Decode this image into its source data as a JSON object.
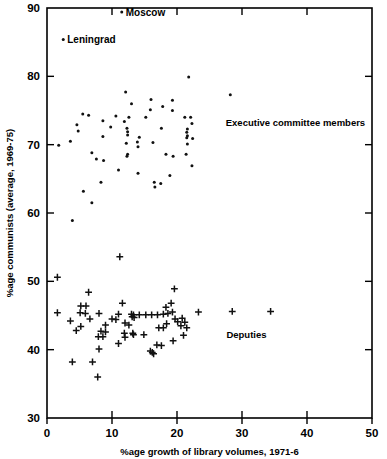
{
  "chart_data": {
    "type": "scatter",
    "title": "",
    "xlabel": "%age  growth of library volumes, 1971-6",
    "ylabel": "%age communists (average, 1969-75)",
    "xlim": [
      0,
      50
    ],
    "ylim": [
      30,
      90
    ],
    "xticks": [
      0,
      10,
      20,
      30,
      40,
      50
    ],
    "yticks": [
      30,
      40,
      50,
      60,
      70,
      80,
      90
    ],
    "xtick_labels": [
      "0",
      "10",
      "20",
      "30",
      "40",
      "50"
    ],
    "ytick_labels": [
      "30",
      "40",
      "50",
      "60",
      "70",
      "80",
      "90"
    ],
    "grid": false,
    "legend_position": "inline-annotations",
    "series": [
      {
        "name": "Executive committee members",
        "marker": "dot",
        "label_text": "Executive committee members",
        "label_x": 27.5,
        "label_y": 73.2,
        "points": [
          [
            11.5,
            89.4
          ],
          [
            2.5,
            85.4
          ],
          [
            21.8,
            79.9
          ],
          [
            12.1,
            77.7
          ],
          [
            28.2,
            77.3
          ],
          [
            16.0,
            76.6
          ],
          [
            19.3,
            76.5
          ],
          [
            13.0,
            76.0
          ],
          [
            17.8,
            75.6
          ],
          [
            15.9,
            75.1
          ],
          [
            19.3,
            75.0
          ],
          [
            5.5,
            74.5
          ],
          [
            6.4,
            74.3
          ],
          [
            10.6,
            74.2
          ],
          [
            12.6,
            74.0
          ],
          [
            15.2,
            74.0
          ],
          [
            21.2,
            74.0
          ],
          [
            22.1,
            74.0
          ],
          [
            8.6,
            73.5
          ],
          [
            11.9,
            73.4
          ],
          [
            22.3,
            73.1
          ],
          [
            4.6,
            72.9
          ],
          [
            9.8,
            72.6
          ],
          [
            12.3,
            72.4
          ],
          [
            17.6,
            72.4
          ],
          [
            21.6,
            72.3
          ],
          [
            4.8,
            72.0
          ],
          [
            12.4,
            71.9
          ],
          [
            21.5,
            71.8
          ],
          [
            12.4,
            71.4
          ],
          [
            21.6,
            71.3
          ],
          [
            8.6,
            71.2
          ],
          [
            14.2,
            71.1
          ],
          [
            21.5,
            71.0
          ],
          [
            22.4,
            70.9
          ],
          [
            1.8,
            69.9
          ],
          [
            3.6,
            70.5
          ],
          [
            13.9,
            70.4
          ],
          [
            16.3,
            70.3
          ],
          [
            12.2,
            70.2
          ],
          [
            21.6,
            70.1
          ],
          [
            14.0,
            69.7
          ],
          [
            6.9,
            68.8
          ],
          [
            12.4,
            68.6
          ],
          [
            12.3,
            68.3
          ],
          [
            18.3,
            68.6
          ],
          [
            19.4,
            68.3
          ],
          [
            21.4,
            68.6
          ],
          [
            7.6,
            67.9
          ],
          [
            8.7,
            67.7
          ],
          [
            22.3,
            66.9
          ],
          [
            11.0,
            66.3
          ],
          [
            14.0,
            65.8
          ],
          [
            18.9,
            65.5
          ],
          [
            8.3,
            64.5
          ],
          [
            16.5,
            64.5
          ],
          [
            17.5,
            64.3
          ],
          [
            16.6,
            63.8
          ],
          [
            5.6,
            63.2
          ],
          [
            6.9,
            61.5
          ],
          [
            3.9,
            58.9
          ]
        ]
      },
      {
        "name": "Deputies",
        "marker": "plus",
        "label_text": "Deputies",
        "label_x": 27.6,
        "label_y": 42.2,
        "points": [
          [
            11.2,
            53.6
          ],
          [
            1.6,
            50.6
          ],
          [
            6.4,
            48.4
          ],
          [
            19.6,
            48.9
          ],
          [
            19.1,
            46.8
          ],
          [
            11.6,
            46.8
          ],
          [
            5.2,
            46.4
          ],
          [
            6.0,
            46.4
          ],
          [
            18.3,
            46.2
          ],
          [
            1.6,
            45.4
          ],
          [
            5.1,
            45.4
          ],
          [
            5.9,
            45.3
          ],
          [
            8.0,
            45.3
          ],
          [
            11.0,
            45.2
          ],
          [
            13.0,
            45.2
          ],
          [
            13.3,
            45.1
          ],
          [
            14.2,
            45.1
          ],
          [
            15.2,
            45.1
          ],
          [
            16.1,
            45.1
          ],
          [
            17.0,
            45.1
          ],
          [
            17.9,
            45.2
          ],
          [
            18.6,
            45.3
          ],
          [
            19.3,
            45.5
          ],
          [
            23.3,
            45.5
          ],
          [
            28.5,
            45.6
          ],
          [
            34.4,
            45.6
          ],
          [
            13.1,
            44.8
          ],
          [
            13.4,
            44.7
          ],
          [
            6.6,
            44.5
          ],
          [
            10.0,
            44.5
          ],
          [
            10.6,
            44.4
          ],
          [
            19.7,
            44.5
          ],
          [
            20.8,
            44.6
          ],
          [
            3.6,
            44.2
          ],
          [
            20.1,
            44.1
          ],
          [
            21.2,
            44.0
          ],
          [
            12.0,
            43.9
          ],
          [
            18.4,
            43.8
          ],
          [
            9.0,
            43.6
          ],
          [
            12.6,
            43.6
          ],
          [
            20.6,
            43.5
          ],
          [
            5.2,
            43.4
          ],
          [
            17.2,
            43.2
          ],
          [
            17.9,
            43.2
          ],
          [
            21.5,
            43.2
          ],
          [
            4.5,
            42.8
          ],
          [
            8.3,
            42.7
          ],
          [
            9.0,
            42.6
          ],
          [
            11.9,
            42.4
          ],
          [
            13.2,
            42.4
          ],
          [
            13.3,
            42.2
          ],
          [
            14.9,
            42.2
          ],
          [
            21.0,
            42.1
          ],
          [
            7.9,
            41.9
          ],
          [
            8.6,
            41.9
          ],
          [
            12.0,
            41.8
          ],
          [
            19.4,
            41.3
          ],
          [
            11.0,
            40.9
          ],
          [
            16.9,
            40.7
          ],
          [
            17.6,
            40.6
          ],
          [
            8.0,
            40.1
          ],
          [
            15.9,
            39.8
          ],
          [
            16.2,
            39.6
          ],
          [
            16.4,
            39.4
          ],
          [
            3.9,
            38.2
          ],
          [
            7.0,
            38.2
          ],
          [
            7.8,
            36.0
          ]
        ]
      }
    ],
    "annotations": [
      {
        "text": "Moscow",
        "x": 11.5,
        "y": 89.4,
        "marker": "dot"
      },
      {
        "text": "Leningrad",
        "x": 2.5,
        "y": 85.4,
        "marker": "dot"
      }
    ]
  }
}
